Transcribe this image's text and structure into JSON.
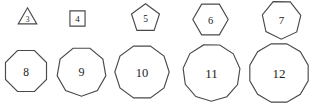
{
  "figure": {
    "background_color": "#ffffff",
    "stroke_color": "#4a4a4a",
    "label_color": "#1c1c1c",
    "rows": 2,
    "columns": 5
  },
  "shapes": [
    {
      "label": "3",
      "name": "triangle",
      "sides": 3,
      "row": 1,
      "column": 1,
      "x": 16,
      "y": 7,
      "size": 23,
      "radius": 11.5,
      "rotation": -90,
      "font_size": 7.5
    },
    {
      "label": "4",
      "name": "square",
      "sides": 4,
      "row": 1,
      "column": 2,
      "x": 66,
      "y": 7,
      "size": 23,
      "radius": 11.5,
      "rotation": -45,
      "font_size": 9
    },
    {
      "label": "5",
      "name": "pentagon",
      "sides": 5,
      "row": 1,
      "column": 3,
      "x": 130,
      "y": 3,
      "size": 31,
      "radius": 15.5,
      "rotation": -90,
      "font_size": 9.5
    },
    {
      "label": "6",
      "name": "hexagon",
      "sides": 6,
      "row": 1,
      "column": 4,
      "x": 192,
      "y": 1,
      "size": 37,
      "radius": 18.5,
      "rotation": 0,
      "font_size": 10.5
    },
    {
      "label": "7",
      "name": "heptagon",
      "sides": 7,
      "row": 1,
      "column": 5,
      "x": 261,
      "y": -1,
      "size": 41,
      "radius": 20.5,
      "rotation": -115,
      "font_size": 11
    },
    {
      "label": "8",
      "name": "octagon",
      "sides": 8,
      "row": 2,
      "column": 1,
      "x": 3,
      "y": 48,
      "size": 46,
      "radius": 23,
      "rotation": -112.5,
      "font_size": 11.5
    },
    {
      "label": "9",
      "name": "nonagon",
      "sides": 9,
      "row": 2,
      "column": 2,
      "x": 56,
      "y": 46,
      "size": 51,
      "radius": 25.5,
      "rotation": -110,
      "font_size": 12
    },
    {
      "label": "10",
      "name": "decagon",
      "sides": 10,
      "row": 2,
      "column": 3,
      "x": 114,
      "y": 44,
      "size": 56,
      "radius": 28,
      "rotation": -108,
      "font_size": 12.5
    },
    {
      "label": "11",
      "name": "hendecagon",
      "sides": 11,
      "row": 2,
      "column": 4,
      "x": 182,
      "y": 43,
      "size": 59,
      "radius": 29.5,
      "rotation": -106,
      "font_size": 13
    },
    {
      "label": "12",
      "name": "dodecagon",
      "sides": 12,
      "row": 2,
      "column": 5,
      "x": 248,
      "y": 42,
      "size": 62,
      "radius": 31,
      "rotation": -105,
      "font_size": 13
    }
  ]
}
